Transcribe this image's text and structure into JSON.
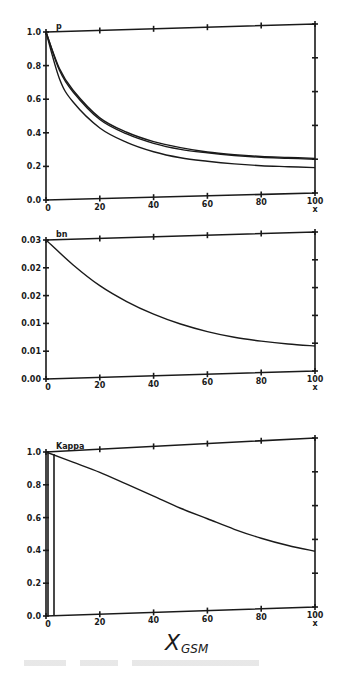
{
  "chart_data": [
    {
      "type": "line",
      "title": "p",
      "xlabel": "x",
      "ylabel": "",
      "xlim": [
        0,
        100
      ],
      "ylim": [
        0.0,
        1.0
      ],
      "x_ticks": [
        "0",
        "20",
        "40",
        "60",
        "80",
        "100"
      ],
      "y_ticks": [
        "0.0",
        "0.2",
        "0.4",
        "0.6",
        "0.8",
        "1.0"
      ],
      "grid": false,
      "legend": null,
      "x": [
        0,
        5,
        10,
        20,
        30,
        40,
        50,
        60,
        70,
        80,
        90,
        100
      ],
      "series": [
        {
          "name": "curve-1",
          "values": [
            1.0,
            0.78,
            0.65,
            0.48,
            0.39,
            0.33,
            0.29,
            0.26,
            0.24,
            0.225,
            0.215,
            0.205
          ]
        },
        {
          "name": "curve-2",
          "values": [
            1.0,
            0.77,
            0.64,
            0.47,
            0.38,
            0.32,
            0.28,
            0.255,
            0.235,
            0.22,
            0.21,
            0.2
          ]
        },
        {
          "name": "curve-3",
          "values": [
            1.0,
            0.72,
            0.58,
            0.42,
            0.33,
            0.27,
            0.23,
            0.205,
            0.185,
            0.17,
            0.16,
            0.15
          ]
        }
      ]
    },
    {
      "type": "line",
      "title": "bn",
      "xlabel": "x",
      "ylabel": "",
      "xlim": [
        0,
        100
      ],
      "ylim": [
        0.0,
        0.03
      ],
      "x_ticks": [
        "0",
        "20",
        "40",
        "60",
        "80",
        "100"
      ],
      "y_ticks": [
        "0.00",
        "0.01",
        "0.01",
        "0.02",
        "0.02",
        "0.03"
      ],
      "grid": false,
      "legend": null,
      "x": [
        0,
        10,
        20,
        30,
        40,
        50,
        60,
        70,
        80,
        90,
        100
      ],
      "series": [
        {
          "name": "bn",
          "values": [
            0.03,
            0.0245,
            0.0198,
            0.0162,
            0.0133,
            0.011,
            0.0092,
            0.0078,
            0.0068,
            0.006,
            0.0054
          ]
        }
      ]
    },
    {
      "type": "line",
      "title": "Kappa",
      "xlabel": "x",
      "ylabel": "",
      "xlim": [
        0,
        100
      ],
      "ylim": [
        0.0,
        1.0
      ],
      "x_ticks": [
        "0",
        "20",
        "40",
        "60",
        "80",
        "100"
      ],
      "y_ticks": [
        "0.0",
        "0.2",
        "0.4",
        "0.6",
        "0.8",
        "1.0"
      ],
      "grid": false,
      "legend": null,
      "x": [
        0,
        10,
        20,
        30,
        40,
        50,
        60,
        70,
        80,
        90,
        100
      ],
      "series": [
        {
          "name": "Kappa",
          "values": [
            1.0,
            0.93,
            0.86,
            0.78,
            0.7,
            0.62,
            0.55,
            0.48,
            0.42,
            0.37,
            0.33
          ]
        }
      ]
    }
  ],
  "figure": {
    "x_axis_annotation": "X",
    "x_axis_annotation_sub": "GSM"
  }
}
